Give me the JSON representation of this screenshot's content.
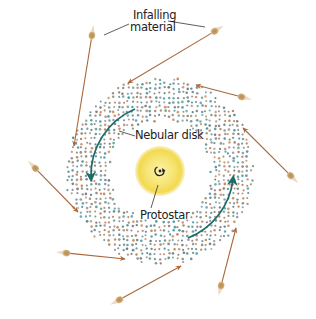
{
  "diagram": {
    "labels": {
      "infalling_line1": "Infalling",
      "infalling_line2": "material",
      "nebular_disk": "Nebular disk",
      "protostar": "Protostar"
    },
    "colors": {
      "background": "#ffffff",
      "infall_arrow": "#a8683c",
      "particle": "#c49a62",
      "particle_tail": "#e8d3b4",
      "disk_dot_colors": [
        "#5f8a8e",
        "#c28456",
        "#7c7c7c",
        "#4e9aa3",
        "#a08a7a"
      ],
      "rotation_arrow": "#1f6b68",
      "protostar_core": "#f6e77a",
      "protostar_edge": "#f0d447",
      "spin_glyph": "#222222",
      "label_text": "#222222",
      "leader_line": "#333333"
    },
    "geometry": {
      "center": [
        160,
        171
      ],
      "disk_outer_radius": 92,
      "disk_inner_radius": 52,
      "protostar_radius": 25
    },
    "infall": [
      {
        "particle": [
          92,
          35
        ],
        "arrow_end": [
          74,
          146
        ]
      },
      {
        "particle": [
          215,
          31
        ],
        "arrow_end": [
          128,
          83
        ]
      },
      {
        "particle": [
          242,
          97
        ],
        "arrow_end": [
          196,
          85
        ]
      },
      {
        "particle": [
          291,
          176
        ],
        "arrow_end": [
          243,
          128
        ]
      },
      {
        "particle": [
          35,
          168
        ],
        "arrow_end": [
          78,
          212
        ]
      },
      {
        "particle": [
          66,
          253
        ],
        "arrow_end": [
          125,
          259
        ]
      },
      {
        "particle": [
          119,
          300
        ],
        "arrow_end": [
          181,
          266
        ]
      },
      {
        "particle": [
          221,
          286
        ],
        "arrow_end": [
          236,
          228
        ]
      }
    ],
    "rotation_arrows": [
      {
        "path": "M 135 109 A 72 72 0 0 0 91 178",
        "head_at": [
          91,
          178
        ]
      },
      {
        "path": "M 188 238 A 72 72 0 0 0 233 179",
        "head_at": [
          233,
          179
        ]
      }
    ],
    "spin_glyph": "↻"
  }
}
